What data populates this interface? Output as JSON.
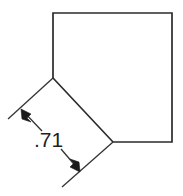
{
  "drawing": {
    "title": "Chamfered square part with chamfer length dimension",
    "type": "engineering-dimension-drawing",
    "canvas": {
      "width": 183,
      "height": 196,
      "background_color": "#ffffff"
    },
    "colors": {
      "outline": "#2b2b2b",
      "dimension": "#333333",
      "arrow": "#1a1a1a",
      "text": "#1f1f1f",
      "background": "#ffffff"
    },
    "part": {
      "name": "chamfered-square",
      "shape": "pentagon",
      "description": "Square with lower-left corner removed by a 45 degree chamfer",
      "vertices": [
        {
          "label": "top-left",
          "x": 53,
          "y": 13
        },
        {
          "label": "top-right",
          "x": 172,
          "y": 13
        },
        {
          "label": "bottom-right",
          "x": 172,
          "y": 142
        },
        {
          "label": "chamfer-bottom-end",
          "x": 113,
          "y": 142
        },
        {
          "label": "chamfer-top-end",
          "x": 53,
          "y": 78
        }
      ],
      "edges": [
        {
          "name": "top-edge",
          "from": "top-left",
          "to": "top-right"
        },
        {
          "name": "right-edge",
          "from": "top-right",
          "to": "bottom-right"
        },
        {
          "name": "bottom-edge",
          "from": "bottom-right",
          "to": "chamfer-bottom-end"
        },
        {
          "name": "chamfer-edge",
          "from": "chamfer-bottom-end",
          "to": "chamfer-top-end",
          "dimensioned": true
        },
        {
          "name": "left-edge",
          "from": "chamfer-top-end",
          "to": "top-left"
        }
      ]
    },
    "dimension": {
      "name": "chamfer-length",
      "value_text": ".71",
      "applies_to": "chamfer-edge",
      "style": "linear-aligned-with-arrows",
      "text_position": {
        "x": 34,
        "y": 147
      },
      "extension_lines": [
        {
          "name": "upper-extension-line",
          "x1": 53,
          "y1": 78,
          "x2": 8,
          "y2": 119
        },
        {
          "name": "lower-extension-line",
          "x1": 113,
          "y1": 142,
          "x2": 62,
          "y2": 187
        }
      ],
      "dimension_line": {
        "x1": 20,
        "y1": 109,
        "x2": 80,
        "y2": 173,
        "broken_for_text": true,
        "segment_a": {
          "x1": 20,
          "y1": 109,
          "x2": 41,
          "y2": 130
        },
        "segment_b": {
          "x1": 61,
          "y1": 150,
          "x2": 80,
          "y2": 173
        }
      },
      "arrowheads": [
        {
          "name": "upper-arrowhead",
          "tip_x": 22,
          "tip_y": 110,
          "direction": "up-left"
        },
        {
          "name": "lower-arrowhead",
          "tip_x": 78,
          "tip_y": 171,
          "direction": "down-right"
        }
      ]
    }
  }
}
